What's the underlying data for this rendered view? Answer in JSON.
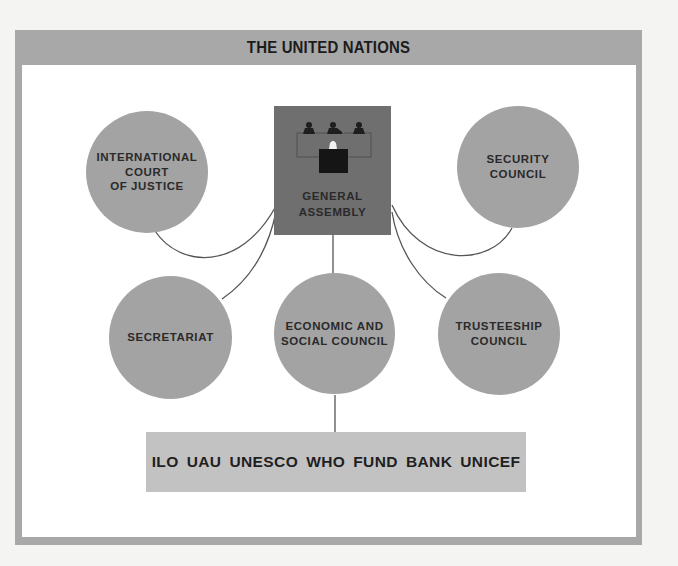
{
  "title": "THE UNITED NATIONS",
  "central_organ": {
    "label": "GENERAL\nASSEMBLY",
    "icon": "assembly-podium-icon"
  },
  "organs": [
    {
      "id": "icj",
      "label": "INTERNATIONAL\nCOURT\nOF JUSTICE"
    },
    {
      "id": "security-council",
      "label": "SECURITY\nCOUNCIL"
    },
    {
      "id": "secretariat",
      "label": "SECRETARIAT"
    },
    {
      "id": "ecosoc",
      "label": "ECONOMIC AND\nSOCIAL COUNCIL"
    },
    {
      "id": "trusteeship-council",
      "label": "TRUSTEESHIP\nCOUNCIL"
    }
  ],
  "specialized_agencies": [
    "ILO",
    "UAU",
    "UNESCO",
    "WHO",
    "FUND",
    "BANK",
    "UNICEF"
  ],
  "connections": [
    {
      "from": "General Assembly",
      "to": "International Court of Justice"
    },
    {
      "from": "General Assembly",
      "to": "Security Council"
    },
    {
      "from": "General Assembly",
      "to": "Secretariat"
    },
    {
      "from": "General Assembly",
      "to": "Economic and Social Council"
    },
    {
      "from": "General Assembly",
      "to": "Trusteeship Council"
    },
    {
      "from": "Economic and Social Council",
      "to": "Specialized Agencies"
    }
  ],
  "colors": {
    "frame": "#a8a8a8",
    "circle": "#a3a3a3",
    "general_assembly": "#6f6f6f",
    "agencies_box": "#c2c2c2",
    "connector": "#555555"
  }
}
